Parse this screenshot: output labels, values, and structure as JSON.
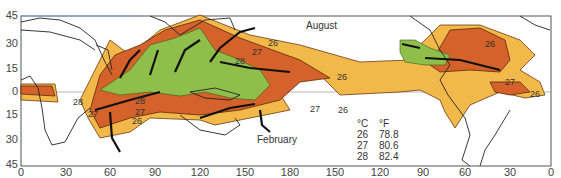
{
  "map": {
    "title": "Sea surface temperature zones and tropical cyclone tracks",
    "seasons": {
      "north": "August",
      "south": "February"
    },
    "y_axis": {
      "labels": [
        "45",
        "30",
        "15",
        "0",
        "15",
        "30",
        "45"
      ]
    },
    "x_axis": {
      "labels": [
        "0",
        "30",
        "60",
        "90",
        "120",
        "150",
        "180",
        "150",
        "120",
        "90",
        "60",
        "30",
        "0"
      ]
    },
    "contour_labels": [
      "26",
      "27",
      "28"
    ],
    "legend": {
      "header": {
        "c": "°C",
        "f": "°F"
      },
      "rows": [
        {
          "c": "26",
          "f": "78.8"
        },
        {
          "c": "27",
          "f": "80.6"
        },
        {
          "c": "28",
          "f": "82.4"
        }
      ]
    },
    "colors": {
      "t26": "#f2b84a",
      "t27": "#d4622a",
      "t28": "#8fbf4a",
      "land_outline": "#222222",
      "track": "#111111"
    }
  }
}
